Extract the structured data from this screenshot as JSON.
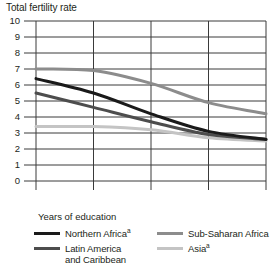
{
  "chart_data": {
    "type": "line",
    "title": "Total fertility rate",
    "xlabel": "Years of education",
    "ylabel": "",
    "categories": [
      "0",
      "1-3",
      "4-6",
      "7-9",
      "10+"
    ],
    "ylim": [
      0,
      10
    ],
    "yticks": [
      "0",
      "1",
      "2",
      "3",
      "4",
      "5",
      "6",
      "7",
      "8",
      "9",
      "10"
    ],
    "grid": true,
    "legend_position": "bottom",
    "series": [
      {
        "name": "Northern Africa",
        "footnote_marker": "a",
        "color": "#1a1a1a",
        "values": [
          6.4,
          5.5,
          4.2,
          3.1,
          2.6
        ]
      },
      {
        "name": "Latin America and Caribbean",
        "footnote_marker": "",
        "color": "#4d4d4d",
        "values": [
          5.5,
          4.6,
          3.7,
          2.9,
          2.6
        ]
      },
      {
        "name": "Sub-Saharan Africa",
        "footnote_marker": "",
        "color": "#8c8c8c",
        "values": [
          7.0,
          6.9,
          6.1,
          4.9,
          4.2
        ]
      },
      {
        "name": "Asia",
        "footnote_marker": "a",
        "color": "#c4c4c4",
        "values": [
          3.4,
          3.4,
          3.2,
          2.7,
          2.5
        ]
      }
    ]
  },
  "legend": {
    "northern_africa_label": "Northern Africa",
    "northern_africa_marker": "a",
    "latin_america_label": "Latin America\nand Caribbean",
    "latin_america_marker": "",
    "sub_saharan_label": "Sub-Saharan Africa",
    "sub_saharan_marker": "",
    "asia_label": "Asia",
    "asia_marker": "a"
  },
  "colors": {
    "axis": "#231f20",
    "grid": "#3a3a3a",
    "background": "#ffffff"
  }
}
